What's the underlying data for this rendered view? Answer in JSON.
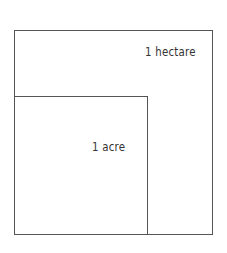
{
  "diagram": {
    "shapes": [
      {
        "id": "hectare",
        "label": "1 hectare",
        "kind": "square",
        "relative_size": "larger"
      },
      {
        "id": "acre",
        "label": "1 acre",
        "kind": "square",
        "relative_size": "smaller",
        "position": "bottom-left corner of hectare"
      }
    ],
    "colors": {
      "stroke": "#555555",
      "text": "#333333",
      "background": "#ffffff"
    }
  }
}
